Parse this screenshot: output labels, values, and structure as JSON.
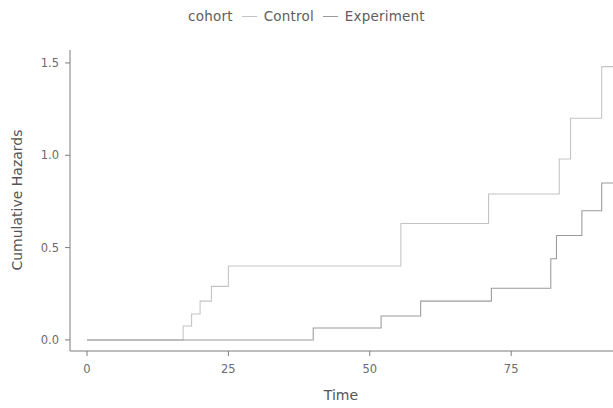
{
  "chart_data": {
    "type": "line",
    "subtype": "step",
    "title": "",
    "xlabel": "Time",
    "ylabel": "Cumulative Hazards",
    "xlim": [
      -3,
      93
    ],
    "ylim": [
      -0.06,
      1.57
    ],
    "xticks": [
      0,
      25,
      50,
      75
    ],
    "xticklabels": [
      "0",
      "25",
      "50",
      "75"
    ],
    "yticks": [
      0.0,
      0.5,
      1.0,
      1.5
    ],
    "yticklabels": [
      "0.0",
      "0.5",
      "1.0",
      "1.5"
    ],
    "grid": false,
    "legend": {
      "title": "cohort",
      "position": "top-center",
      "entries": [
        {
          "label": "Control",
          "color": "#c3c3c3"
        },
        {
          "label": "Experiment",
          "color": "#9a9a9a"
        }
      ]
    },
    "series": [
      {
        "name": "Control",
        "color": "#c3c3c3",
        "x": [
          0,
          16,
          17,
          18.5,
          20,
          22,
          25,
          55.5,
          71,
          83.5,
          85.5,
          91
        ],
        "y": [
          0.0,
          0.0,
          0.075,
          0.14,
          0.21,
          0.29,
          0.4,
          0.63,
          0.79,
          0.98,
          1.2,
          1.48
        ]
      },
      {
        "name": "Experiment",
        "color": "#9a9a9a",
        "x": [
          0,
          27,
          40,
          52,
          59,
          71.5,
          82,
          83,
          87.5,
          91
        ],
        "y": [
          0.0,
          0.0,
          0.065,
          0.13,
          0.21,
          0.28,
          0.44,
          0.565,
          0.7,
          0.85
        ]
      }
    ]
  }
}
